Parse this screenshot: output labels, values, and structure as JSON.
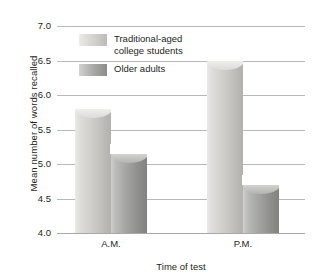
{
  "chart_data": {
    "type": "bar",
    "title": "",
    "xlabel": "Time of test",
    "ylabel": "Mean number of words recalled",
    "categories": [
      "A.M.",
      "P.M."
    ],
    "series": [
      {
        "name": "Traditional-aged college students",
        "values": [
          5.8,
          6.5
        ],
        "color": "#cdccc9"
      },
      {
        "name": "Older adults",
        "values": [
          5.15,
          4.7
        ],
        "color": "#a0a09e"
      }
    ],
    "ylim": [
      4.0,
      7.0
    ],
    "ytick_labels": [
      "7.0",
      "6.5",
      "6.0",
      "5.5",
      "5.0",
      "4.5",
      "4.0"
    ],
    "ytick_values": [
      7.0,
      6.5,
      6.0,
      5.5,
      5.0,
      4.5,
      4.0
    ],
    "grid": true,
    "legend_position": "inside-top-left"
  },
  "legend": {
    "items": [
      {
        "label": "Traditional-aged\ncollege students",
        "swatch": "light"
      },
      {
        "label": "Older adults",
        "swatch": "dark"
      }
    ]
  },
  "axes": {
    "y_title": "Mean number of words recalled",
    "x_title": "Time of test"
  }
}
